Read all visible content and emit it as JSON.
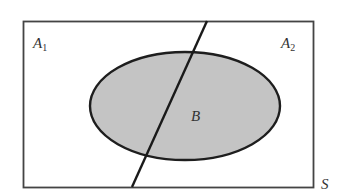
{
  "diagram": {
    "type": "venn-partition",
    "sample_space": {
      "label": "S"
    },
    "regions": [
      {
        "id": "A1",
        "letter": "A",
        "subscript": "1"
      },
      {
        "id": "A2",
        "letter": "A",
        "subscript": "2"
      }
    ],
    "event": {
      "label": "B"
    },
    "colors": {
      "outline": "#2a2a2a",
      "event_fill": "#c4c4c4",
      "background": "#ffffff"
    }
  }
}
